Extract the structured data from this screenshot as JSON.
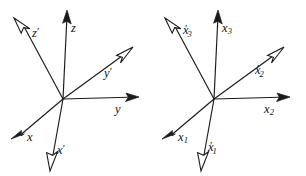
{
  "figure": {
    "background_color": "#ffffff",
    "line_color": "#1a1a1a",
    "width": 306,
    "height": 176
  },
  "diagrams": [
    {
      "name": "left-diagram",
      "origin": {
        "x": 63,
        "y": 99
      },
      "axes": [
        {
          "id": "z",
          "label": "z",
          "base": "z",
          "subscript": "",
          "prime": false,
          "arrowhead": "solid",
          "direction": "up",
          "tip": {
            "x": 67,
            "y": 11
          },
          "label_pos": {
            "x": 71,
            "y": 22
          }
        },
        {
          "id": "y",
          "label": "y",
          "base": "y",
          "subscript": "",
          "prime": false,
          "arrowhead": "solid",
          "direction": "right",
          "tip": {
            "x": 139,
            "y": 97
          },
          "label_pos": {
            "x": 115,
            "y": 103
          }
        },
        {
          "id": "x",
          "label": "x",
          "base": "x",
          "subscript": "",
          "prime": false,
          "arrowhead": "solid",
          "direction": "lower-left",
          "tip": {
            "x": 11,
            "y": 139
          },
          "label_pos": {
            "x": 27,
            "y": 131
          }
        },
        {
          "id": "z-prime",
          "label": "z'",
          "base": "z",
          "subscript": "",
          "prime": true,
          "arrowhead": "hollow",
          "direction": "upper-left",
          "tip": {
            "x": 14,
            "y": 18
          },
          "label_pos": {
            "x": 32,
            "y": 26
          }
        },
        {
          "id": "y-prime",
          "label": "y'",
          "base": "y",
          "subscript": "",
          "prime": true,
          "arrowhead": "hollow",
          "direction": "upper-right",
          "tip": {
            "x": 133,
            "y": 47
          },
          "label_pos": {
            "x": 104,
            "y": 66
          }
        },
        {
          "id": "x-prime",
          "label": "x'",
          "base": "x",
          "subscript": "",
          "prime": true,
          "arrowhead": "hollow",
          "direction": "down",
          "tip": {
            "x": 50,
            "y": 171
          },
          "label_pos": {
            "x": 57,
            "y": 143
          }
        }
      ]
    },
    {
      "name": "right-diagram",
      "origin": {
        "x": 214,
        "y": 99
      },
      "axes": [
        {
          "id": "x3",
          "label": "x3",
          "base": "x",
          "subscript": "3",
          "prime": false,
          "arrowhead": "solid",
          "direction": "up",
          "tip": {
            "x": 218,
            "y": 11
          },
          "label_pos": {
            "x": 222,
            "y": 22
          }
        },
        {
          "id": "x2",
          "label": "x2",
          "base": "x",
          "subscript": "2",
          "prime": false,
          "arrowhead": "solid",
          "direction": "right",
          "tip": {
            "x": 290,
            "y": 97
          },
          "label_pos": {
            "x": 264,
            "y": 103
          }
        },
        {
          "id": "x1",
          "label": "x1",
          "base": "x",
          "subscript": "1",
          "prime": false,
          "arrowhead": "solid",
          "direction": "lower-left",
          "tip": {
            "x": 162,
            "y": 139
          },
          "label_pos": {
            "x": 178,
            "y": 131
          }
        },
        {
          "id": "x3-prime",
          "label": "x'3",
          "base": "x",
          "subscript": "3",
          "prime": true,
          "arrowhead": "hollow",
          "direction": "upper-left",
          "tip": {
            "x": 165,
            "y": 18
          },
          "label_pos": {
            "x": 183,
            "y": 26
          }
        },
        {
          "id": "x2-prime",
          "label": "x'2",
          "base": "x",
          "subscript": "2",
          "prime": true,
          "arrowhead": "hollow",
          "direction": "upper-right",
          "tip": {
            "x": 284,
            "y": 47
          },
          "label_pos": {
            "x": 255,
            "y": 66
          }
        },
        {
          "id": "x1-prime",
          "label": "x'1",
          "base": "x",
          "subscript": "1",
          "prime": true,
          "arrowhead": "hollow",
          "direction": "down",
          "tip": {
            "x": 201,
            "y": 171
          },
          "label_pos": {
            "x": 208,
            "y": 143
          }
        }
      ]
    }
  ]
}
